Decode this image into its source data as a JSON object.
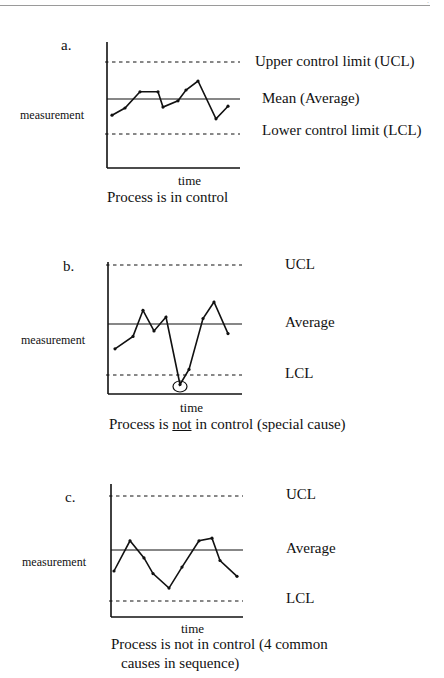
{
  "page": {
    "corner_mark": "·"
  },
  "chart_data": [
    {
      "type": "line",
      "panel": "a.",
      "title": "Process is in control",
      "xlabel": "time",
      "ylabel": "measurement",
      "reference_lines": {
        "ucl": {
          "label": "Upper control limit (UCL)",
          "value": 2.0
        },
        "mean": {
          "label": "Mean (Average)",
          "value": 0.0
        },
        "lcl": {
          "label": "Lower control limit (LCL)",
          "value": -2.0
        }
      },
      "x": [
        1,
        2,
        3,
        4,
        5,
        6,
        7,
        8,
        9,
        10
      ],
      "values": [
        -0.9,
        -0.5,
        0.4,
        0.4,
        -0.45,
        -0.1,
        0.5,
        1.0,
        -1.1,
        -0.4
      ],
      "ylim": [
        -3.8,
        3.2
      ],
      "grid": false,
      "legend": "inline right labels"
    },
    {
      "type": "line",
      "panel": "b.",
      "title": "Process is not in control (special cause)",
      "title_parts": {
        "pre": "Process is ",
        "underlined": "not",
        "post": " in control (special cause)"
      },
      "xlabel": "time",
      "ylabel": "measurement",
      "reference_lines": {
        "ucl": {
          "label": "UCL",
          "value": 2.0
        },
        "mean": {
          "label": "Average",
          "value": 0.0
        },
        "lcl": {
          "label": "LCL",
          "value": -2.0
        }
      },
      "x": [
        1,
        2,
        3,
        4,
        5,
        6,
        7,
        8,
        9,
        10
      ],
      "values": [
        -0.9,
        -0.45,
        0.5,
        -0.25,
        0.25,
        -2.2,
        -1.65,
        0.2,
        0.8,
        -0.35
      ],
      "highlighted_point": {
        "x": 6,
        "value": -2.2,
        "marker": "circle"
      },
      "ylim": [
        -2.8,
        2.2
      ],
      "grid": false
    },
    {
      "type": "line",
      "panel": "c.",
      "title": "Process is not in control (4 common causes in sequence)",
      "title_lines": [
        "Process is not in control (4 common",
        "causes in sequence)"
      ],
      "xlabel": "time",
      "ylabel": "measurement",
      "reference_lines": {
        "ucl": {
          "label": "UCL",
          "value": 2.0
        },
        "mean": {
          "label": "Average",
          "value": 0.0
        },
        "lcl": {
          "label": "LCL",
          "value": -2.0
        }
      },
      "x": [
        1,
        2,
        3,
        4,
        5,
        6,
        7,
        8,
        9,
        10
      ],
      "values": [
        -0.8,
        0.35,
        -0.3,
        -0.9,
        -1.45,
        -0.65,
        0.35,
        0.45,
        -0.4,
        -1.0
      ],
      "ylim": [
        -2.6,
        2.2
      ],
      "grid": false
    }
  ]
}
